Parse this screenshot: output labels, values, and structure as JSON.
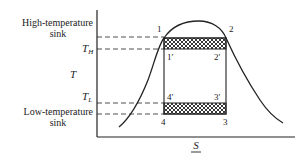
{
  "diagram": {
    "type": "T-S diagram (Carnot cycle under vapor dome)",
    "axes": {
      "y_label": "T",
      "x_label": "S",
      "x_label_underlined": true
    },
    "left_labels": {
      "high_sink_line1": "High-temperature",
      "high_sink_line2": "sink",
      "t_high": "T",
      "t_high_sub": "H",
      "t_low": "T",
      "t_low_sub": "L",
      "low_sink_line1": "Low-temperature",
      "low_sink_line2": "sink"
    },
    "points": {
      "p1": "1",
      "p2": "2",
      "p1p": "1′",
      "p2p": "2′",
      "p3p": "3′",
      "p4p": "4′",
      "p3": "3",
      "p4": "4"
    },
    "colors": {
      "ink": "#222222",
      "background": "#ffffff"
    }
  }
}
